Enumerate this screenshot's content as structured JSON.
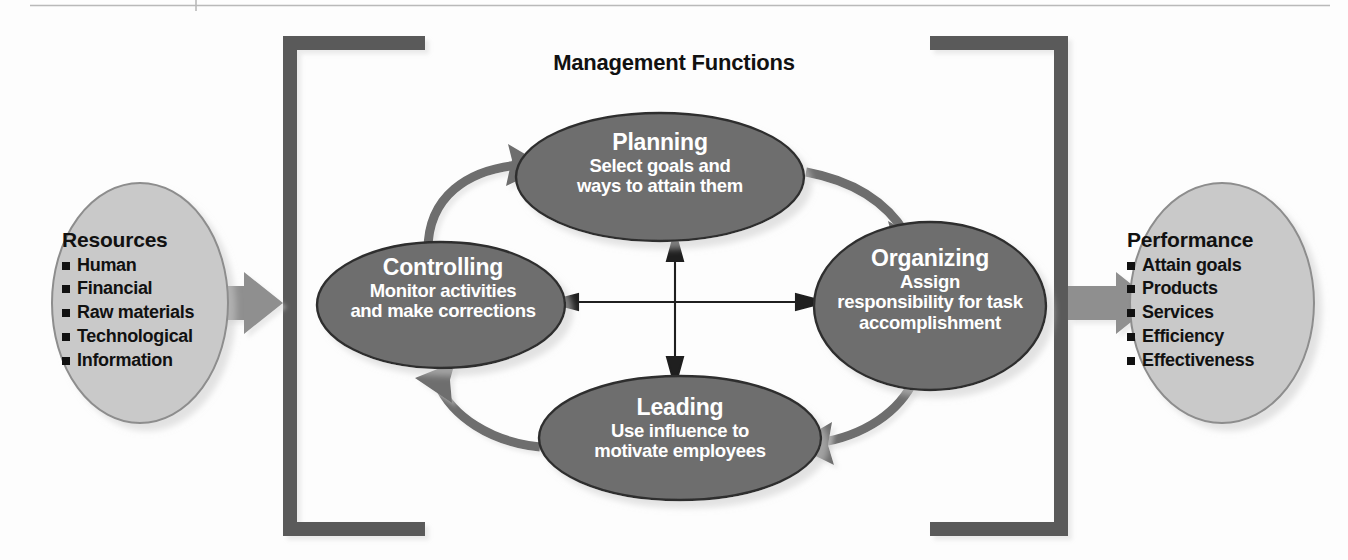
{
  "diagram": {
    "title": "Management Functions",
    "type": "process-cycle-diagram",
    "colors": {
      "function_ellipse_fill": "#6e6e6e",
      "io_ellipse_fill": "#c9c9c9",
      "bracket": "#5a5a5a",
      "block_arrow": "#8a8a8a",
      "curved_arrow": "#6e6e6e",
      "cross_arrow": "#1a1a1a",
      "function_text": "#ffffff",
      "io_text": "#111111",
      "background": "#fdfdfd"
    }
  },
  "input": {
    "name": "resources",
    "title": "Resources",
    "items": [
      "Human",
      "Financial",
      "Raw materials",
      "Technological",
      "Information"
    ]
  },
  "output": {
    "name": "performance",
    "title": "Performance",
    "items": [
      "Attain goals",
      "Products",
      "Services",
      "Efficiency",
      "Effectiveness"
    ]
  },
  "functions": {
    "planning": {
      "title": "Planning",
      "body_lines": [
        "Select goals and",
        "ways to attain them"
      ]
    },
    "organizing": {
      "title": "Organizing",
      "body_lines": [
        "Assign",
        "responsibility for task",
        "accomplishment"
      ]
    },
    "leading": {
      "title": "Leading",
      "body_lines": [
        "Use influence to",
        "motivate employees"
      ]
    },
    "controlling": {
      "title": "Controlling",
      "body_lines": [
        "Monitor activities",
        "and make corrections"
      ]
    }
  },
  "flow": {
    "input_arrow": "resources-to-management-functions",
    "output_arrow": "management-functions-to-performance",
    "cycle_order": [
      "Planning",
      "Organizing",
      "Leading",
      "Controlling"
    ],
    "cross_links": [
      "planning-leading",
      "controlling-organizing"
    ]
  }
}
